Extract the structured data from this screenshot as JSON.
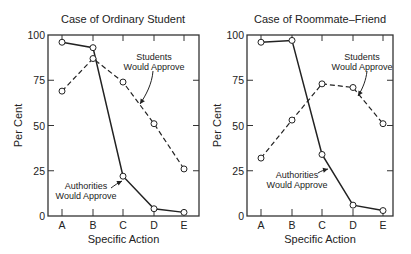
{
  "chart_data": [
    {
      "type": "line",
      "title": "Case of Ordinary Student",
      "xlabel": "Specific Action",
      "ylabel": "Per Cent",
      "categories": [
        "A",
        "B",
        "C",
        "D",
        "E"
      ],
      "ylim": [
        0,
        100
      ],
      "yticks": [
        0,
        25,
        50,
        75,
        100
      ],
      "grid": false,
      "series": [
        {
          "name": "Authorities Would Approve",
          "style": "solid",
          "values": [
            96,
            93,
            22,
            4,
            2
          ]
        },
        {
          "name": "Students Would Approve",
          "style": "dashed",
          "values": [
            69,
            87,
            74,
            51,
            26
          ]
        }
      ],
      "annotations": [
        {
          "text": [
            "Students",
            "Would Approve"
          ],
          "series": "Students Would Approve"
        },
        {
          "text": [
            "Authorities",
            "Would Approve"
          ],
          "series": "Authorities Would Approve"
        }
      ]
    },
    {
      "type": "line",
      "title": "Case of Roommate–Friend",
      "xlabel": "Specific Action",
      "ylabel": "Per Cent",
      "categories": [
        "A",
        "B",
        "C",
        "D",
        "E"
      ],
      "ylim": [
        0,
        100
      ],
      "yticks": [
        0,
        25,
        50,
        75,
        100
      ],
      "grid": false,
      "series": [
        {
          "name": "Authorities Would Approve",
          "style": "solid",
          "values": [
            96,
            97,
            34,
            6,
            3
          ]
        },
        {
          "name": "Students Would Approve",
          "style": "dashed",
          "values": [
            32,
            53,
            73,
            71,
            51
          ]
        }
      ],
      "annotations": [
        {
          "text": [
            "Students",
            "Would Approve"
          ],
          "series": "Students Would Approve"
        },
        {
          "text": [
            "Authorities",
            "Would Approve"
          ],
          "series": "Authorities Would Approve"
        }
      ]
    }
  ]
}
